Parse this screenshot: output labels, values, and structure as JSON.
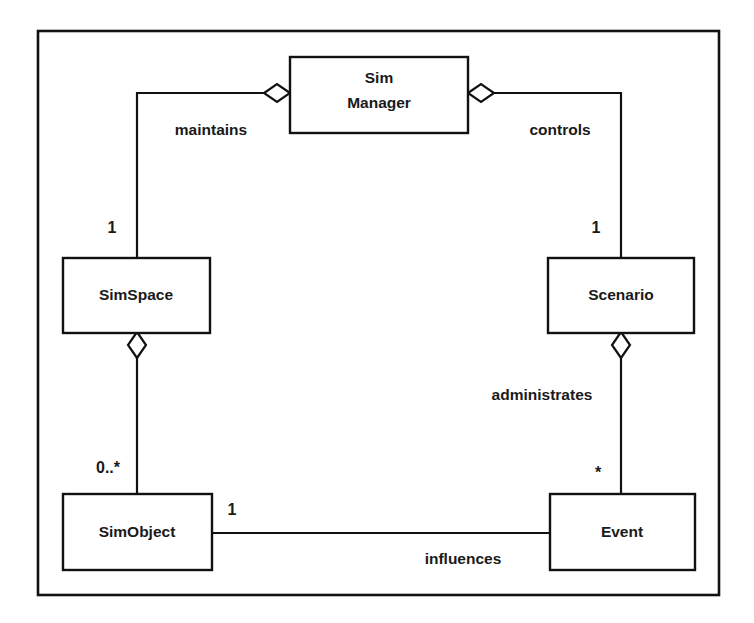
{
  "diagram": {
    "type": "uml-class-diagram",
    "frame": {
      "label": ""
    },
    "classes": [
      {
        "id": "sim-manager",
        "name_line1": "Sim",
        "name_line2": "Manager",
        "name": "Sim Manager"
      },
      {
        "id": "simspace",
        "name": "SimSpace"
      },
      {
        "id": "scenario",
        "name": "Scenario"
      },
      {
        "id": "simobject",
        "name": "SimObject"
      },
      {
        "id": "event",
        "name": "Event"
      }
    ],
    "associations": [
      {
        "id": "maintains",
        "label": "maintains",
        "from": "sim-manager",
        "to": "simspace",
        "kind": "aggregation",
        "multiplicity_target": "1"
      },
      {
        "id": "controls",
        "label": "controls",
        "from": "sim-manager",
        "to": "scenario",
        "kind": "aggregation",
        "multiplicity_target": "1"
      },
      {
        "id": "contains",
        "label": "",
        "from": "simspace",
        "to": "simobject",
        "kind": "aggregation",
        "multiplicity_target": "0..*"
      },
      {
        "id": "administrates",
        "label": "administrates",
        "from": "scenario",
        "to": "event",
        "kind": "aggregation",
        "multiplicity_target": "*"
      },
      {
        "id": "influences",
        "label": "influences",
        "from": "simobject",
        "to": "event",
        "kind": "association",
        "multiplicity_source": "1"
      }
    ],
    "labels": {
      "maintains": "maintains",
      "controls": "controls",
      "administrates": "administrates",
      "influences": "influences",
      "mult_simspace": "1",
      "mult_scenario": "1",
      "mult_simobject": "0..*",
      "mult_event": "*",
      "mult_simobject_influences": "1"
    },
    "colors": {
      "line": "#111111",
      "fill": "#ffffff",
      "text": "#1a1a1a"
    }
  }
}
